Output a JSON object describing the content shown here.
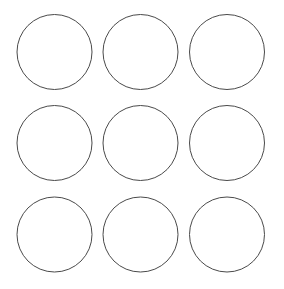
{
  "canvas": {
    "width": 284,
    "height": 289,
    "background_color": "#ffffff",
    "title": "Circle Grid"
  },
  "figure": {
    "name": "circle-grid",
    "rows": 3,
    "columns": 3,
    "shape_count": 9,
    "shape_type": "circle",
    "stroke_color": "#4a4a4a",
    "stroke_width": 1,
    "fill": "none",
    "radius": 37.5,
    "column_centers": [
      54.5,
      140.5,
      227.0
    ],
    "row_centers": [
      52.0,
      143.0,
      234.5
    ],
    "column_gap": 11,
    "row_gap": 15,
    "margin_left": 17,
    "margin_top": 14,
    "margin_right": 19,
    "margin_bottom": 17,
    "circles": [
      {
        "id": "circle-r1-c1",
        "row": 1,
        "column": 1,
        "cx": 54.5,
        "cy": 52.0,
        "r": 37.5
      },
      {
        "id": "circle-r1-c2",
        "row": 1,
        "column": 2,
        "cx": 140.5,
        "cy": 52.0,
        "r": 37.5
      },
      {
        "id": "circle-r1-c3",
        "row": 1,
        "column": 3,
        "cx": 227.0,
        "cy": 52.0,
        "r": 37.5
      },
      {
        "id": "circle-r2-c1",
        "row": 2,
        "column": 1,
        "cx": 54.5,
        "cy": 143.0,
        "r": 37.5
      },
      {
        "id": "circle-r2-c2",
        "row": 2,
        "column": 2,
        "cx": 140.5,
        "cy": 143.0,
        "r": 37.5
      },
      {
        "id": "circle-r2-c3",
        "row": 2,
        "column": 3,
        "cx": 227.0,
        "cy": 143.0,
        "r": 37.5
      },
      {
        "id": "circle-r3-c1",
        "row": 3,
        "column": 1,
        "cx": 54.5,
        "cy": 234.5,
        "r": 37.5
      },
      {
        "id": "circle-r3-c2",
        "row": 3,
        "column": 2,
        "cx": 140.5,
        "cy": 234.5,
        "r": 37.5
      },
      {
        "id": "circle-r3-c3",
        "row": 3,
        "column": 3,
        "cx": 227.0,
        "cy": 234.5,
        "r": 37.5
      }
    ]
  }
}
